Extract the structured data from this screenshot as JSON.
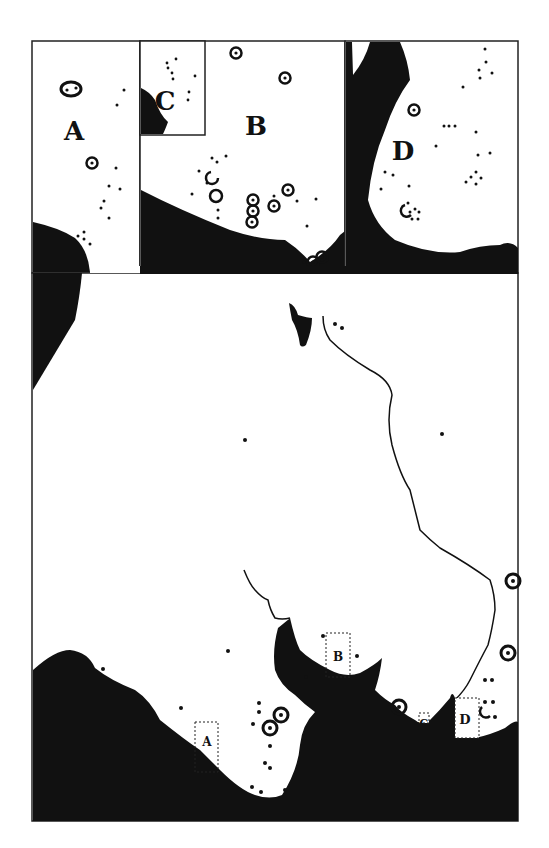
{
  "figure": {
    "type": "archaeological site distribution map",
    "colors": {
      "land": "#ffffff",
      "water": "#111111",
      "ink": "#111111",
      "frame": "#222222"
    }
  },
  "insets": [
    {
      "id": "A",
      "label": "A"
    },
    {
      "id": "B",
      "label": "B"
    },
    {
      "id": "C",
      "label": "C"
    },
    {
      "id": "D",
      "label": "D"
    }
  ],
  "main_map": {
    "inset_boxes": [
      {
        "label": "A"
      },
      {
        "label": "B"
      },
      {
        "label": "C"
      },
      {
        "label": "D"
      }
    ]
  },
  "legend_symbols": {
    "dot": "small site",
    "ringed-dot": "larger site"
  }
}
